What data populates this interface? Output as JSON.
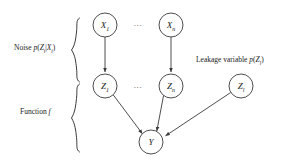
{
  "figure": {
    "name": "probabilistic-graphical-model-leakage-diagram",
    "background_color": "#ffffff",
    "stroke_color": "#3a3a3a",
    "text_color": "#1a1a1a",
    "width": 296,
    "height": 163
  },
  "nodes": {
    "x1": {
      "label": "X",
      "subscript": "1",
      "cx": 105,
      "cy": 25,
      "r": 12
    },
    "xn": {
      "label": "X",
      "subscript": "n",
      "cx": 171,
      "cy": 25,
      "r": 12
    },
    "z1": {
      "label": "Z",
      "subscript": "1",
      "cx": 105,
      "cy": 86,
      "r": 12
    },
    "zn": {
      "label": "Z",
      "subscript": "n",
      "cx": 171,
      "cy": 86,
      "r": 12
    },
    "zl": {
      "label": "Z",
      "subscript": "l",
      "cx": 241,
      "cy": 86,
      "r": 12
    },
    "y": {
      "label": "Y",
      "subscript": "",
      "cx": 151,
      "cy": 142,
      "r": 12
    }
  },
  "ellipsis": {
    "top": {
      "text": "...",
      "x": 138,
      "y": 26
    },
    "middle": {
      "text": "...",
      "x": 138,
      "y": 88
    }
  },
  "edges": [
    {
      "name": "x1-to-z1",
      "from": "x1",
      "to": "z1"
    },
    {
      "name": "xn-to-zn",
      "from": "xn",
      "to": "zn"
    },
    {
      "name": "z1-to-y",
      "from": "z1",
      "to": "y"
    },
    {
      "name": "zn-to-y",
      "from": "zn",
      "to": "y"
    },
    {
      "name": "zl-to-y",
      "from": "zl",
      "to": "y"
    }
  ],
  "annotations": {
    "noise": {
      "text_prefix": "Noise ",
      "formula": "p(Zᵢ|Xᵢ)",
      "full_text": "Noise p(Z_i|X_i)"
    },
    "function": {
      "text_prefix": "Function ",
      "symbol": "f",
      "full_text": "Function f"
    },
    "leakage": {
      "text_prefix": "Leakage variable ",
      "formula": "p(Zₗ)",
      "full_text": "Leakage variable p(Z_l)"
    }
  },
  "braces": {
    "noise_brace": {
      "name": "noise-brace",
      "top": 18,
      "bottom": 82,
      "x": 76
    },
    "function_brace": {
      "name": "function-brace",
      "top": 84,
      "bottom": 152,
      "x": 76
    }
  }
}
